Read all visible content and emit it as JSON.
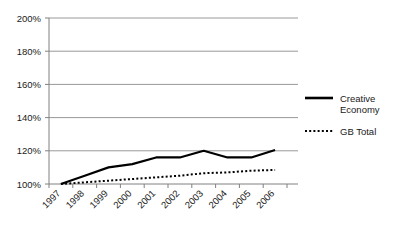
{
  "chart_data": {
    "type": "line",
    "title": "",
    "xlabel": "",
    "ylabel": "",
    "categories": [
      "1997",
      "1998",
      "1999",
      "2000",
      "2001",
      "2002",
      "2003",
      "2004",
      "2005",
      "2006"
    ],
    "series": [
      {
        "name": "Creative Economy",
        "style": "solid",
        "color": "#000000",
        "values": [
          100,
          105,
          110,
          112,
          116,
          116,
          120,
          116,
          116,
          120.5
        ]
      },
      {
        "name": "GB Total",
        "style": "dotted",
        "color": "#000000",
        "values": [
          100,
          101,
          102,
          103,
          104,
          105,
          106.5,
          107,
          108,
          108.5
        ]
      }
    ],
    "ylim": [
      100,
      200
    ],
    "yticks": [
      100,
      120,
      140,
      160,
      180,
      200
    ],
    "ytick_labels": [
      "100%",
      "120%",
      "140%",
      "160%",
      "180%",
      "200%"
    ],
    "grid": true,
    "grid_color": "#999999",
    "axis_color": "#808080",
    "legend_position": "right",
    "xtick_rotation": -45
  },
  "legend": {
    "entries": [
      {
        "label_line1": "Creative",
        "label_line2": "Economy",
        "marker": "solid-line-swatch"
      },
      {
        "label_line1": "GB Total",
        "label_line2": "",
        "marker": "dotted-line-swatch"
      }
    ]
  },
  "plot": {
    "left": 49,
    "right": 287,
    "top": 18,
    "bottom": 184
  }
}
